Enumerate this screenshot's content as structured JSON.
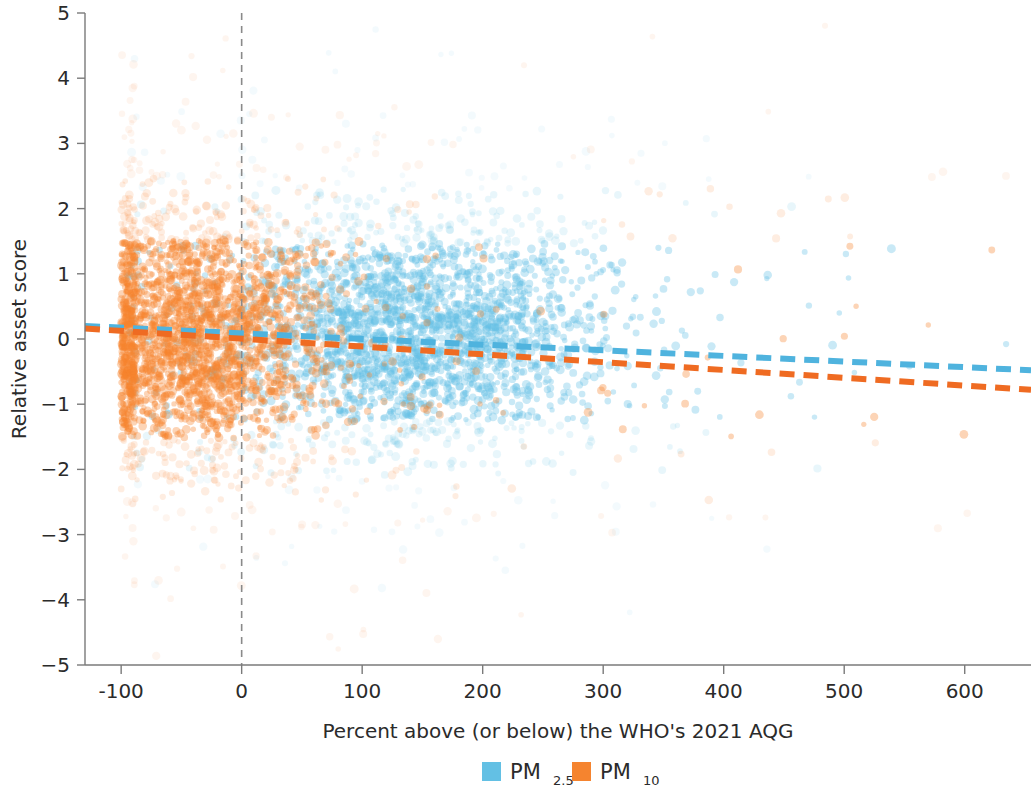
{
  "chart_data": {
    "type": "scatter",
    "title": "",
    "xlabel": "Percent above (or below) the WHO's 2021 AQG",
    "ylabel": "Relative asset score",
    "xlim": [
      -130,
      655
    ],
    "ylim": [
      -5,
      5
    ],
    "xticks": [
      -100,
      0,
      100,
      200,
      300,
      400,
      500,
      600
    ],
    "xtick_labels": [
      "-100",
      "0",
      "100",
      "200",
      "300",
      "400",
      "500",
      "600"
    ],
    "yticks": [
      -5,
      -4,
      -3,
      -2,
      -1,
      0,
      1,
      2,
      3,
      4,
      5
    ],
    "ytick_labels": [
      "−5",
      "−4",
      "−3",
      "−2",
      "−1",
      "0",
      "1",
      "2",
      "3",
      "4",
      "5"
    ],
    "grid": false,
    "legend_position": "bottom-center",
    "reference_lines": [
      {
        "name": "zero-vertical",
        "orientation": "vertical",
        "x": 0,
        "style": "dashed",
        "color": "#8a8a8a"
      }
    ],
    "series": [
      {
        "name": "PM2.5",
        "label": "PM",
        "label_sub": "2.5",
        "color": "#63C0E4",
        "marker": "circle",
        "opacity": 0.35,
        "n_points_approx": 2600,
        "x_center": 145,
        "x_spread": 75,
        "x_min": -95,
        "x_max": 640,
        "y_center": 0.1,
        "y_spread": 0.85,
        "trendline": {
          "style": "dashed",
          "color": "#4FB3DE",
          "x_start": -130,
          "y_start": 0.2,
          "x_end": 655,
          "y_end": -0.48,
          "slope_per_100": -0.0866,
          "intercept": 0.09
        }
      },
      {
        "name": "PM10",
        "label": "PM",
        "label_sub": "10",
        "color": "#F5842F",
        "marker": "circle",
        "opacity": 0.35,
        "n_points_approx": 2600,
        "x_center": -35,
        "x_spread": 50,
        "x_min": -100,
        "x_max": 640,
        "y_center": 0.0,
        "y_spread": 0.95,
        "trendline": {
          "style": "dashed",
          "color": "#EF6B22",
          "x_start": -130,
          "y_start": 0.16,
          "x_end": 655,
          "y_end": -0.78,
          "slope_per_100": -0.1197,
          "intercept": -0.0
        }
      }
    ],
    "legend": [
      {
        "label": "PM",
        "sub": "2.5",
        "color": "#63C0E4"
      },
      {
        "label": "PM",
        "sub": "10",
        "color": "#F5842F"
      }
    ]
  },
  "axes": {
    "y_title": "Relative asset score",
    "x_title": "Percent above (or below) the WHO's 2021 AQG"
  },
  "legend": {
    "pm25_label": "PM",
    "pm25_sub": "2.5",
    "pm10_label": "PM",
    "pm10_sub": "10"
  }
}
